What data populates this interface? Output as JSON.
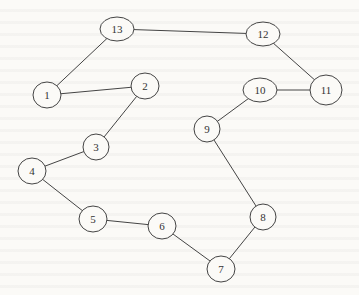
{
  "diagram": {
    "type": "cycle-graph",
    "nodes": [
      {
        "id": "1",
        "label": "1",
        "x": 47,
        "y": 95,
        "rx": 14,
        "ry": 13
      },
      {
        "id": "2",
        "label": "2",
        "x": 145,
        "y": 86,
        "rx": 14,
        "ry": 13
      },
      {
        "id": "3",
        "label": "3",
        "x": 96,
        "y": 147,
        "rx": 13,
        "ry": 13
      },
      {
        "id": "4",
        "label": "4",
        "x": 32,
        "y": 171,
        "rx": 14,
        "ry": 13
      },
      {
        "id": "5",
        "label": "5",
        "x": 93,
        "y": 219,
        "rx": 14,
        "ry": 13
      },
      {
        "id": "6",
        "label": "6",
        "x": 162,
        "y": 226,
        "rx": 14,
        "ry": 13
      },
      {
        "id": "7",
        "label": "7",
        "x": 221,
        "y": 269,
        "rx": 14,
        "ry": 13
      },
      {
        "id": "8",
        "label": "8",
        "x": 263,
        "y": 217,
        "rx": 13,
        "ry": 13
      },
      {
        "id": "9",
        "label": "9",
        "x": 207,
        "y": 129,
        "rx": 13,
        "ry": 13
      },
      {
        "id": "10",
        "label": "10",
        "x": 260,
        "y": 90,
        "rx": 17,
        "ry": 12
      },
      {
        "id": "11",
        "label": "11",
        "x": 326,
        "y": 90,
        "rx": 16,
        "ry": 15
      },
      {
        "id": "12",
        "label": "12",
        "x": 263,
        "y": 34,
        "rx": 17,
        "ry": 12
      },
      {
        "id": "13",
        "label": "13",
        "x": 117,
        "y": 29,
        "rx": 17,
        "ry": 12
      }
    ],
    "edges": [
      [
        "13",
        "12"
      ],
      [
        "13",
        "1"
      ],
      [
        "1",
        "2"
      ],
      [
        "2",
        "3"
      ],
      [
        "3",
        "4"
      ],
      [
        "4",
        "5"
      ],
      [
        "5",
        "6"
      ],
      [
        "6",
        "7"
      ],
      [
        "7",
        "8"
      ],
      [
        "8",
        "9"
      ],
      [
        "9",
        "10"
      ],
      [
        "10",
        "11"
      ],
      [
        "11",
        "12"
      ]
    ],
    "colors": {
      "background": "#fbfaf7",
      "stroke": "#444444",
      "text": "#333333"
    }
  }
}
